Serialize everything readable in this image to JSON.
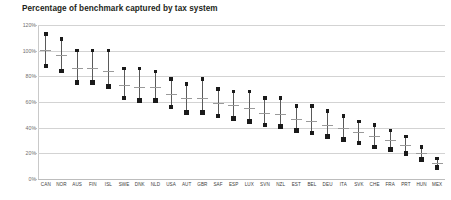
{
  "chart_data": {
    "type": "scatter",
    "title": "Percentage of benchmark captured by tax system",
    "xlabel": "",
    "ylabel": "",
    "ylim": [
      0,
      120
    ],
    "ytick_labels": [
      "120%",
      "100%",
      "80%",
      "60%",
      "40%",
      "20%",
      "0%"
    ],
    "ytick_values": [
      120,
      100,
      80,
      60,
      40,
      20,
      0
    ],
    "grid": true,
    "legend": "none",
    "categories": [
      "CAN",
      "NOR",
      "AUS",
      "FIN",
      "ISL",
      "SWE",
      "DNK",
      "NLD",
      "USA",
      "AUT",
      "GBR",
      "SAF",
      "ESP",
      "LUX",
      "SVN",
      "NZL",
      "EST",
      "BEL",
      "DEU",
      "ITA",
      "SVK",
      "CHE",
      "FRA",
      "PRT",
      "HUN",
      "MEX"
    ],
    "series": [
      {
        "name": "Upper estimate",
        "marker": "square-small",
        "values": [
          113,
          109,
          100,
          100,
          100,
          86,
          86,
          84,
          78,
          74,
          78,
          70,
          68,
          68,
          63,
          63,
          57,
          57,
          53,
          49,
          45,
          42,
          38,
          33,
          25,
          16
        ]
      },
      {
        "name": "Central estimate",
        "marker": "horizontal-tick",
        "values": [
          100,
          96,
          86,
          86,
          84,
          73,
          71,
          71,
          66,
          63,
          63,
          59,
          57,
          55,
          51,
          50,
          46,
          45,
          42,
          39,
          36,
          33,
          30,
          26,
          20,
          12
        ]
      },
      {
        "name": "Lower estimate",
        "marker": "square-large",
        "values": [
          88,
          84,
          75,
          75,
          72,
          63,
          61,
          61,
          56,
          52,
          52,
          49,
          47,
          45,
          42,
          41,
          38,
          36,
          33,
          31,
          28,
          25,
          23,
          20,
          15,
          9
        ]
      }
    ]
  }
}
